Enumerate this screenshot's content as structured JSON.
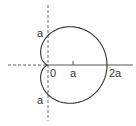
{
  "diagram": {
    "labels": {
      "origin": "0",
      "x_tick_a": "a",
      "x_tick_2a": "2a",
      "y_top_a": "a",
      "y_bottom_a": "a"
    },
    "colors": {
      "curve": "#333333",
      "axis": "#444444",
      "background": "#ffffff"
    }
  }
}
